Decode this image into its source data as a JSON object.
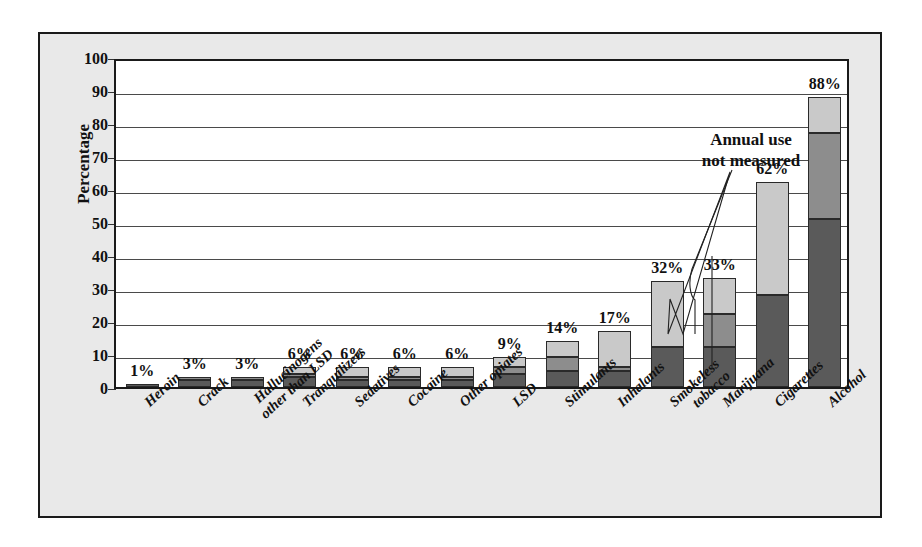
{
  "chart_data": {
    "type": "bar",
    "title": "Twelfth-graders",
    "xlabel": "",
    "ylabel": "Percentage",
    "ylim": [
      0,
      100
    ],
    "ytick_step": 10,
    "yticks": [
      "100",
      "90",
      "80",
      "70",
      "60",
      "50",
      "40",
      "30",
      "20",
      "10",
      "0"
    ],
    "grid": true,
    "stacked": true,
    "categories": [
      "Heroin",
      "Crack",
      "Hallucinogens\nother than LSD",
      "Tranquilizers",
      "Sedatives",
      "Cocaine",
      "Other opiates",
      "LSD",
      "Stimulants",
      "Inhalants",
      "Smokeless\ntobacco",
      "Marijuana",
      "Cigarettes",
      "Alcohol"
    ],
    "series": [
      {
        "name": "dark",
        "values": [
          1,
          2,
          2,
          3,
          2,
          2,
          2,
          4,
          5,
          5,
          12,
          12,
          28,
          51
        ]
      },
      {
        "name": "mid",
        "values": [
          0,
          1,
          1,
          1,
          1,
          1,
          1,
          2,
          4,
          1,
          0,
          10,
          0,
          26
        ]
      },
      {
        "name": "light",
        "values": [
          0,
          0,
          0,
          2,
          3,
          3,
          3,
          3,
          5,
          11,
          20,
          11,
          34,
          11
        ]
      }
    ],
    "totals": [
      1,
      3,
      3,
      6,
      6,
      6,
      6,
      9,
      14,
      17,
      32,
      33,
      62,
      88
    ],
    "data_labels": [
      "1%",
      "3%",
      "3%",
      "6%",
      "6%",
      "6%",
      "6%",
      "9%",
      "14%",
      "17%",
      "32%",
      "33%",
      "62%",
      "88%"
    ],
    "annotations": [
      {
        "text": "Annual use\nnot measured",
        "line1": "Annual use",
        "line2": "not measured",
        "targets": [
          "Smokeless tobacco",
          "Cigarettes"
        ]
      }
    ],
    "colors": {
      "dark": "#5a5a5a",
      "mid": "#8d8d8d",
      "light": "#c9c9c9",
      "axis": "#1a1a1a",
      "plot_background": "#ffffff",
      "frame_background": "#e9e9e9"
    }
  }
}
